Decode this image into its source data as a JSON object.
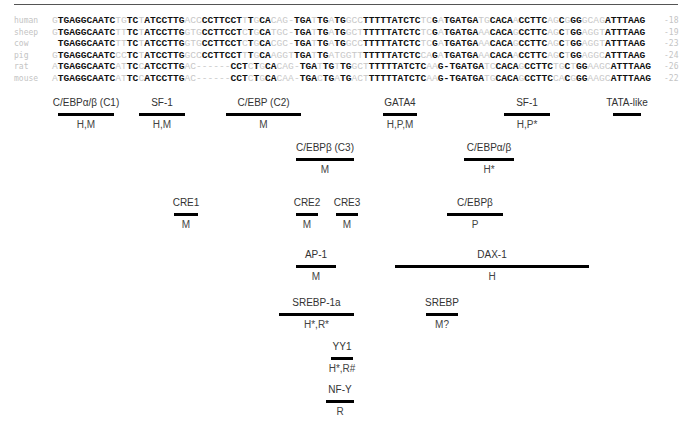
{
  "alignment": {
    "rows": [
      {
        "species": "human",
        "position": "-18",
        "segments": [
          {
            "t": "G",
            "c": false
          },
          {
            "t": "TGAGGCAATC",
            "c": true
          },
          {
            "t": "TG",
            "c": false
          },
          {
            "t": "TC",
            "c": true
          },
          {
            "t": "T",
            "c": false
          },
          {
            "t": "ATCCTTG",
            "c": true
          },
          {
            "t": "ACC",
            "c": false
          },
          {
            "t": "CCTTCCT",
            "c": true
          },
          {
            "t": "T",
            "c": false
          },
          {
            "t": "T",
            "c": true
          },
          {
            "t": "G",
            "c": false
          },
          {
            "t": "CA",
            "c": true
          },
          {
            "t": "CAG-",
            "c": false
          },
          {
            "t": "TGA",
            "c": true
          },
          {
            "t": "T",
            "c": false
          },
          {
            "t": "TG",
            "c": true
          },
          {
            "t": "A",
            "c": false
          },
          {
            "t": "TG",
            "c": true
          },
          {
            "t": "GCC",
            "c": false
          },
          {
            "t": "TTTTTATCTC",
            "c": true
          },
          {
            "t": "TC",
            "c": false
          },
          {
            "t": "G",
            "c": true
          },
          {
            "t": "A",
            "c": false
          },
          {
            "t": "TGATGA",
            "c": true
          },
          {
            "t": "TG",
            "c": false
          },
          {
            "t": "CACA",
            "c": true
          },
          {
            "t": "A",
            "c": false
          },
          {
            "t": "CCTTC",
            "c": true
          },
          {
            "t": "AG",
            "c": false
          },
          {
            "t": "C",
            "c": true
          },
          {
            "t": "G",
            "c": false
          },
          {
            "t": "GG",
            "c": true
          },
          {
            "t": "GCAG",
            "c": false
          },
          {
            "t": "ATTTAAG",
            "c": true
          }
        ]
      },
      {
        "species": "sheep",
        "position": "-19",
        "segments": [
          {
            "t": "G",
            "c": false
          },
          {
            "t": "TGAGGCAATC",
            "c": true
          },
          {
            "t": "TT",
            "c": false
          },
          {
            "t": "TC",
            "c": true
          },
          {
            "t": "T",
            "c": false
          },
          {
            "t": "ATCCTTG",
            "c": true
          },
          {
            "t": "GTG",
            "c": false
          },
          {
            "t": "CCTTCCT",
            "c": true
          },
          {
            "t": "C",
            "c": false
          },
          {
            "t": "T",
            "c": true
          },
          {
            "t": "G",
            "c": false
          },
          {
            "t": "CA",
            "c": true
          },
          {
            "t": "TGC-",
            "c": false
          },
          {
            "t": "TGA",
            "c": true
          },
          {
            "t": "T",
            "c": false
          },
          {
            "t": "TG",
            "c": true
          },
          {
            "t": "A",
            "c": false
          },
          {
            "t": "TG",
            "c": true
          },
          {
            "t": "GCT",
            "c": false
          },
          {
            "t": "TTTTTATCTC",
            "c": true
          },
          {
            "t": "TC",
            "c": false
          },
          {
            "t": "G",
            "c": true
          },
          {
            "t": "A",
            "c": false
          },
          {
            "t": "TGATGA",
            "c": true
          },
          {
            "t": "AA",
            "c": false
          },
          {
            "t": "CACA",
            "c": true
          },
          {
            "t": "G",
            "c": false
          },
          {
            "t": "CCTTC",
            "c": true
          },
          {
            "t": "AG",
            "c": false
          },
          {
            "t": "C",
            "c": true
          },
          {
            "t": "T",
            "c": false
          },
          {
            "t": "GG",
            "c": true
          },
          {
            "t": "AGGT",
            "c": false
          },
          {
            "t": "ATTTAAG",
            "c": true
          }
        ]
      },
      {
        "species": "cow",
        "position": "-23",
        "segments": [
          {
            "t": " ",
            "c": false
          },
          {
            "t": "TGAGGCAATC",
            "c": true
          },
          {
            "t": "TT",
            "c": false
          },
          {
            "t": "TC",
            "c": true
          },
          {
            "t": "T",
            "c": false
          },
          {
            "t": "ATCCTTG",
            "c": true
          },
          {
            "t": "GTG",
            "c": false
          },
          {
            "t": "CCTTCCT",
            "c": true
          },
          {
            "t": "C",
            "c": false
          },
          {
            "t": "T",
            "c": true
          },
          {
            "t": "G",
            "c": false
          },
          {
            "t": "CA",
            "c": true
          },
          {
            "t": "CGC-",
            "c": false
          },
          {
            "t": "TGA",
            "c": true
          },
          {
            "t": "T",
            "c": false
          },
          {
            "t": "TG",
            "c": true
          },
          {
            "t": "A",
            "c": false
          },
          {
            "t": "TG",
            "c": true
          },
          {
            "t": "GCC",
            "c": false
          },
          {
            "t": "TTTTTATCTC",
            "c": true
          },
          {
            "t": "TC",
            "c": false
          },
          {
            "t": "G",
            "c": true
          },
          {
            "t": "A",
            "c": false
          },
          {
            "t": "TGATGA",
            "c": true
          },
          {
            "t": "AA",
            "c": false
          },
          {
            "t": "CACA",
            "c": true
          },
          {
            "t": "G",
            "c": false
          },
          {
            "t": "CCTTC",
            "c": true
          },
          {
            "t": "AG",
            "c": false
          },
          {
            "t": "C",
            "c": true
          },
          {
            "t": "T",
            "c": false
          },
          {
            "t": "GG",
            "c": true
          },
          {
            "t": "AGGT",
            "c": false
          },
          {
            "t": "ATTTAAG",
            "c": true
          }
        ]
      },
      {
        "species": "pig",
        "position": "-24",
        "segments": [
          {
            "t": "G",
            "c": false
          },
          {
            "t": "TGAGGCAATC",
            "c": true
          },
          {
            "t": "CC",
            "c": false
          },
          {
            "t": "TC",
            "c": true
          },
          {
            "t": "T",
            "c": false
          },
          {
            "t": "ATCCTTG",
            "c": true
          },
          {
            "t": "GCC",
            "c": false
          },
          {
            "t": "CCTTCCT",
            "c": true
          },
          {
            "t": "T",
            "c": false
          },
          {
            "t": "T",
            "c": true
          },
          {
            "t": "G",
            "c": false
          },
          {
            "t": "CA",
            "c": true
          },
          {
            "t": "AGGT",
            "c": false
          },
          {
            "t": "TGA",
            "c": true
          },
          {
            "t": "T",
            "c": false
          },
          {
            "t": "TG",
            "c": true
          },
          {
            "t": "ATGGTT",
            "c": false
          },
          {
            "t": "TTTTTATCTC",
            "c": true
          },
          {
            "t": "CA",
            "c": false
          },
          {
            "t": "G",
            "c": true
          },
          {
            "t": "A",
            "c": false
          },
          {
            "t": "TGATGA",
            "c": true
          },
          {
            "t": "AA",
            "c": false
          },
          {
            "t": "CACA",
            "c": true
          },
          {
            "t": "A",
            "c": false
          },
          {
            "t": "CCTTC",
            "c": true
          },
          {
            "t": "AG",
            "c": false
          },
          {
            "t": "C",
            "c": true
          },
          {
            "t": "T",
            "c": false
          },
          {
            "t": "GG",
            "c": true
          },
          {
            "t": "AGGC",
            "c": false
          },
          {
            "t": "ATTTAAG",
            "c": true
          }
        ]
      },
      {
        "species": "rat",
        "position": "-26",
        "segments": [
          {
            "t": "A",
            "c": false
          },
          {
            "t": "TGAGGCAATC",
            "c": true
          },
          {
            "t": "AT",
            "c": false
          },
          {
            "t": "TC",
            "c": true
          },
          {
            "t": "C",
            "c": false
          },
          {
            "t": "ATCCTTG",
            "c": true
          },
          {
            "t": "AC------",
            "c": false
          },
          {
            "t": "CCT",
            "c": true
          },
          {
            "t": "C",
            "c": false
          },
          {
            "t": "T",
            "c": true
          },
          {
            "t": "G",
            "c": false
          },
          {
            "t": "CA",
            "c": true
          },
          {
            "t": "CAG-",
            "c": false
          },
          {
            "t": "TGA",
            "c": true
          },
          {
            "t": "T",
            "c": false
          },
          {
            "t": "TG",
            "c": true
          },
          {
            "t": "T",
            "c": false
          },
          {
            "t": "TG",
            "c": true
          },
          {
            "t": "GCT",
            "c": false
          },
          {
            "t": "TTTTTATCTC",
            "c": true
          },
          {
            "t": "AA",
            "c": false
          },
          {
            "t": "G-",
            "c": true
          },
          {
            "t": "",
            "c": false
          },
          {
            "t": "TGATGA",
            "c": true
          },
          {
            "t": "TC",
            "c": false
          },
          {
            "t": "CACA",
            "c": true
          },
          {
            "t": "G",
            "c": false
          },
          {
            "t": "CCTTC",
            "c": true
          },
          {
            "t": "TG",
            "c": false
          },
          {
            "t": "C",
            "c": true
          },
          {
            "t": "T",
            "c": false
          },
          {
            "t": "GG",
            "c": true
          },
          {
            "t": "AAGC",
            "c": false
          },
          {
            "t": "ATTTAAG",
            "c": true
          }
        ]
      },
      {
        "species": "mouse",
        "position": "-22",
        "segments": [
          {
            "t": "A",
            "c": false
          },
          {
            "t": "TGAGGCAATC",
            "c": true
          },
          {
            "t": "AT",
            "c": false
          },
          {
            "t": "TC",
            "c": true
          },
          {
            "t": "C",
            "c": false
          },
          {
            "t": "ATCCTTG",
            "c": true
          },
          {
            "t": "AC------",
            "c": false
          },
          {
            "t": "CCT",
            "c": true
          },
          {
            "t": "C",
            "c": false
          },
          {
            "t": "T",
            "c": true
          },
          {
            "t": "G",
            "c": false
          },
          {
            "t": "CA",
            "c": true
          },
          {
            "t": "CAA-",
            "c": false
          },
          {
            "t": "TGA",
            "c": true
          },
          {
            "t": "C",
            "c": false
          },
          {
            "t": "TG",
            "c": true
          },
          {
            "t": "A",
            "c": false
          },
          {
            "t": "TG",
            "c": true
          },
          {
            "t": "ACT",
            "c": false
          },
          {
            "t": "TTTTTATCTC",
            "c": true
          },
          {
            "t": "AA",
            "c": false
          },
          {
            "t": "G-",
            "c": true
          },
          {
            "t": "",
            "c": false
          },
          {
            "t": "TGATGA",
            "c": true
          },
          {
            "t": "TG",
            "c": false
          },
          {
            "t": "CACA",
            "c": true
          },
          {
            "t": "G",
            "c": false
          },
          {
            "t": "CCTTC",
            "c": true
          },
          {
            "t": "CA",
            "c": false
          },
          {
            "t": "C",
            "c": true
          },
          {
            "t": "G",
            "c": false
          },
          {
            "t": "GG",
            "c": true
          },
          {
            "t": "AAGC",
            "c": false
          },
          {
            "t": "ATTTAAG",
            "c": true
          }
        ]
      }
    ]
  },
  "sites": [
    {
      "label": "C/EBPα/β (C1)",
      "species": "H,M",
      "x": 58,
      "y": 96,
      "w": 56
    },
    {
      "label": "SF-1",
      "species": "H,M",
      "x": 139,
      "y": 96,
      "w": 46
    },
    {
      "label": "C/EBP (C2)",
      "species": "M",
      "x": 226,
      "y": 96,
      "w": 75
    },
    {
      "label": "GATA4",
      "species": "H,P,M",
      "x": 383,
      "y": 96,
      "w": 34
    },
    {
      "label": "SF-1",
      "species": "H,P*",
      "x": 504,
      "y": 96,
      "w": 46
    },
    {
      "label": "TATA-like",
      "species": "",
      "x": 613,
      "y": 96,
      "w": 28
    },
    {
      "label": "C/EBPβ (C3)",
      "species": "M",
      "x": 296,
      "y": 141,
      "w": 58
    },
    {
      "label": "C/EBPα/β",
      "species": "H*",
      "x": 464,
      "y": 141,
      "w": 50
    },
    {
      "label": "CRE1",
      "species": "M",
      "x": 174,
      "y": 196,
      "w": 24
    },
    {
      "label": "CRE2",
      "species": "M",
      "x": 296,
      "y": 196,
      "w": 22
    },
    {
      "label": "CRE3",
      "species": "M",
      "x": 336,
      "y": 196,
      "w": 22
    },
    {
      "label": "C/EBPβ",
      "species": "P",
      "x": 447,
      "y": 196,
      "w": 56
    },
    {
      "label": "AP-1",
      "species": "M",
      "x": 296,
      "y": 248,
      "w": 40
    },
    {
      "label": "DAX-1",
      "species": "H",
      "x": 395,
      "y": 248,
      "w": 194
    },
    {
      "label": "SREBP-1a",
      "species": "H*,R*",
      "x": 279,
      "y": 296,
      "w": 75
    },
    {
      "label": "SREBP",
      "species": "M?",
      "x": 426,
      "y": 296,
      "w": 32
    },
    {
      "label": "YY1",
      "species": "H*,R#",
      "x": 331,
      "y": 340,
      "w": 22
    },
    {
      "label": "NF-Y",
      "species": "R",
      "x": 326,
      "y": 383,
      "w": 28
    }
  ]
}
